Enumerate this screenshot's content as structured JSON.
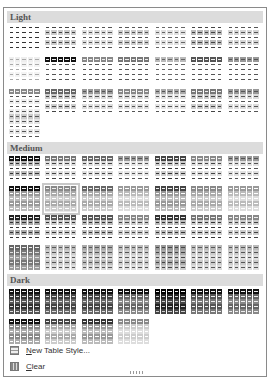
{
  "sections": [
    {
      "label": "Light",
      "top": 3,
      "rows_top": [
        17,
        49,
        81,
        106
      ],
      "count": 22
    },
    {
      "label": "Medium",
      "top": 134,
      "rows_top": [
        148,
        178,
        207,
        237
      ],
      "count": 28
    },
    {
      "label": "Dark",
      "top": 266,
      "rows_top": [
        281,
        311
      ],
      "count": 11
    }
  ],
  "selected": {
    "section": "Medium",
    "index": 8
  },
  "menu": {
    "new_table_style": {
      "label": "New Table Style...",
      "accel": "N"
    },
    "clear": {
      "label": "Clear",
      "accel": "C"
    }
  },
  "styles": {
    "light": [
      [
        "#fff",
        "#fff",
        "#fff",
        "#333"
      ],
      [
        "#fff",
        "#ccc",
        "#fff",
        "#444"
      ],
      [
        "#fff",
        "#ddd",
        "#fff",
        "#555"
      ],
      [
        "#fff",
        "#ccc",
        "#fff",
        "#555"
      ],
      [
        "#fff",
        "#e0e0e0",
        "#fff",
        "#666"
      ],
      [
        "#fff",
        "#bbb",
        "#fff",
        "#444"
      ],
      [
        "#fff",
        "#d5d5d5",
        "#fff",
        "#555"
      ],
      [
        "#eee",
        "#f4f4f4",
        "#fff",
        "#aaa"
      ],
      [
        "#111",
        "#fff",
        "#fff",
        "#555"
      ],
      [
        "#888",
        "#fff",
        "#fff",
        "#555"
      ],
      [
        "#777",
        "#fff",
        "#fff",
        "#555"
      ],
      [
        "#bbb",
        "#fff",
        "#fff",
        "#666"
      ],
      [
        "#555",
        "#fff",
        "#fff",
        "#555"
      ],
      [
        "#999",
        "#fff",
        "#fff",
        "#555"
      ],
      [
        "#888",
        "#fff",
        "#eee",
        "#555"
      ],
      [
        "#666",
        "#ccc",
        "#fff",
        "#444"
      ],
      [
        "#999",
        "#ddd",
        "#fff",
        "#555"
      ],
      [
        "#888",
        "#ddd",
        "#fff",
        "#555"
      ],
      [
        "#aaa",
        "#e5e5e5",
        "#fff",
        "#555"
      ],
      [
        "#777",
        "#ccc",
        "#fff",
        "#444"
      ],
      [
        "#999",
        "#ddd",
        "#fff",
        "#555"
      ],
      [
        "#ccc",
        "#e5e5e5",
        "#fff",
        "#555"
      ]
    ],
    "medium": [
      [
        "#111",
        "#bbb",
        "#fff",
        "#333"
      ],
      [
        "#777",
        "#ddd",
        "#fff",
        "#444"
      ],
      [
        "#666",
        "#ddd",
        "#fff",
        "#444"
      ],
      [
        "#999",
        "#e5e5e5",
        "#fff",
        "#555"
      ],
      [
        "#444",
        "#ccc",
        "#fff",
        "#333"
      ],
      [
        "#888",
        "#ddd",
        "#fff",
        "#444"
      ],
      [
        "#999",
        "#e0e0e0",
        "#fff",
        "#555"
      ],
      [
        "#111",
        "#999",
        "#bbb",
        "#fff"
      ],
      [
        "#888",
        "#aaa",
        "#ccc",
        "#fff"
      ],
      [
        "#666",
        "#aaa",
        "#ccc",
        "#fff"
      ],
      [
        "#999",
        "#bbb",
        "#ddd",
        "#fff"
      ],
      [
        "#444",
        "#999",
        "#bbb",
        "#fff"
      ],
      [
        "#888",
        "#aaa",
        "#ccc",
        "#fff"
      ],
      [
        "#999",
        "#bbb",
        "#ddd",
        "#fff"
      ],
      [
        "#222",
        "#aaa",
        "#fff",
        "#333"
      ],
      [
        "#555",
        "#ccc",
        "#fff",
        "#333"
      ],
      [
        "#555",
        "#bbb",
        "#fff",
        "#333"
      ],
      [
        "#888",
        "#ccc",
        "#fff",
        "#444"
      ],
      [
        "#333",
        "#bbb",
        "#fff",
        "#333"
      ],
      [
        "#777",
        "#ccc",
        "#fff",
        "#333"
      ],
      [
        "#888",
        "#ccc",
        "#fff",
        "#444"
      ],
      [
        "#666",
        "#777",
        "#999",
        "#ddd"
      ],
      [
        "#bbb",
        "#ccc",
        "#e0e0e0",
        "#555"
      ],
      [
        "#aaa",
        "#bbb",
        "#d8d8d8",
        "#555"
      ],
      [
        "#bbb",
        "#ccc",
        "#e0e0e0",
        "#555"
      ],
      [
        "#999",
        "#aaa",
        "#ccc",
        "#444"
      ],
      [
        "#bbb",
        "#ccc",
        "#ddd",
        "#555"
      ],
      [
        "#bbb",
        "#ccc",
        "#e0e0e0",
        "#555"
      ]
    ],
    "dark": [
      [
        "#111",
        "#333",
        "#555",
        "#ddd"
      ],
      [
        "#111",
        "#444",
        "#666",
        "#ddd"
      ],
      [
        "#111",
        "#444",
        "#666",
        "#ddd"
      ],
      [
        "#111",
        "#666",
        "#888",
        "#eee"
      ],
      [
        "#000",
        "#222",
        "#444",
        "#ccc"
      ],
      [
        "#111",
        "#555",
        "#777",
        "#eee"
      ],
      [
        "#111",
        "#666",
        "#888",
        "#eee"
      ],
      [
        "#111",
        "#888",
        "#aaa",
        "#fff"
      ],
      [
        "#444",
        "#aaa",
        "#ccc",
        "#fff"
      ],
      [
        "#333",
        "#999",
        "#bbb",
        "#fff"
      ],
      [
        "#888",
        "#ccc",
        "#ddd",
        "#fff"
      ]
    ]
  }
}
